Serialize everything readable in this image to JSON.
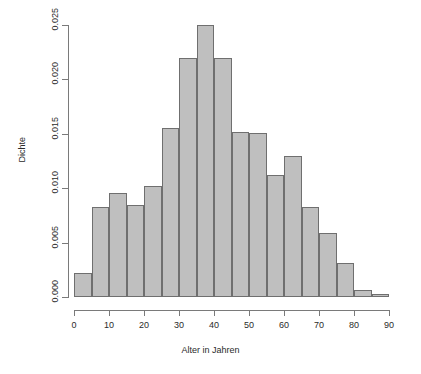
{
  "chart_data": {
    "type": "bar",
    "title": "",
    "subtitle": "",
    "xlabel": "Alter in Jahren",
    "ylabel": "Dichte",
    "xlim": [
      0,
      90
    ],
    "ylim": [
      0.0,
      0.025
    ],
    "grid": false,
    "legend": null,
    "bin_width": 5,
    "xticks": [
      0,
      10,
      20,
      30,
      40,
      50,
      60,
      70,
      80,
      90
    ],
    "xtick_labels": [
      "0",
      "10",
      "20",
      "30",
      "40",
      "50",
      "60",
      "70",
      "80",
      "90"
    ],
    "yticks": [
      0.0,
      0.005,
      0.01,
      0.015,
      0.02,
      0.025
    ],
    "ytick_labels": [
      "0.000",
      "0.005",
      "0.010",
      "0.015",
      "0.020",
      "0.025"
    ],
    "bin_edges": [
      0,
      5,
      10,
      15,
      20,
      25,
      30,
      35,
      40,
      45,
      50,
      55,
      60,
      65,
      70,
      75,
      80,
      85,
      90
    ],
    "categories": [
      "0-5",
      "5-10",
      "10-15",
      "15-20",
      "20-25",
      "25-30",
      "30-35",
      "35-40",
      "40-45",
      "45-50",
      "50-55",
      "55-60",
      "60-65",
      "65-70",
      "70-75",
      "75-80",
      "80-85",
      "85-90"
    ],
    "values": [
      0.0022,
      0.0083,
      0.0096,
      0.0085,
      0.0102,
      0.0155,
      0.022,
      0.025,
      0.022,
      0.0152,
      0.0151,
      0.0112,
      0.013,
      0.0083,
      0.0059,
      0.0031,
      0.0006,
      0.0003
    ],
    "bar_fill_color": "#bfbfbf",
    "bar_border_color": "#6f6f6f",
    "axis_color": "#7a7a7a",
    "background_color": "#ffffff"
  }
}
